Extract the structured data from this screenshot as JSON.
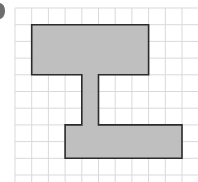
{
  "figure": {
    "label_glyph": "partial question-number marker",
    "grid": {
      "origin_x": 15,
      "origin_y": 8,
      "cell_size": 16.7,
      "cols": 11,
      "rows": 10,
      "line_color": "#d9d9d9"
    },
    "shape": {
      "name": "I-beam composite rectilinear shape",
      "fill": "#bcbcbc",
      "stroke": "#2b2b2b",
      "vertices_grid_units": [
        [
          1,
          1
        ],
        [
          8,
          1
        ],
        [
          8,
          4
        ],
        [
          5,
          4
        ],
        [
          5,
          7
        ],
        [
          10,
          7
        ],
        [
          10,
          9
        ],
        [
          3,
          9
        ],
        [
          3,
          7
        ],
        [
          4,
          7
        ],
        [
          4,
          4
        ],
        [
          1,
          4
        ]
      ]
    }
  }
}
